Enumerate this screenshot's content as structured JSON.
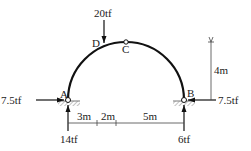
{
  "diagram": {
    "type": "three-hinged semicircular arch",
    "points": {
      "A": {
        "label": "A"
      },
      "B": {
        "label": "B"
      },
      "C": {
        "label": "C"
      },
      "D": {
        "label": "D"
      }
    },
    "loads": {
      "point_load": {
        "label": "20tf",
        "at": "D",
        "direction": "down"
      }
    },
    "reactions": {
      "A_horizontal": {
        "label": "7.5tf",
        "direction": "right"
      },
      "A_vertical": {
        "label": "14tf",
        "direction": "up"
      },
      "B_horizontal": {
        "label": "7.5tf",
        "direction": "left"
      },
      "B_vertical": {
        "label": "6tf",
        "direction": "up"
      }
    },
    "dimensions": {
      "rise": {
        "label": "4m"
      },
      "seg1": {
        "label": "3m"
      },
      "seg2": {
        "label": "2m"
      },
      "seg3": {
        "label": "5m"
      }
    },
    "colors": {
      "line": "#111111",
      "hatch": "#888888",
      "dim": "#444444"
    }
  }
}
